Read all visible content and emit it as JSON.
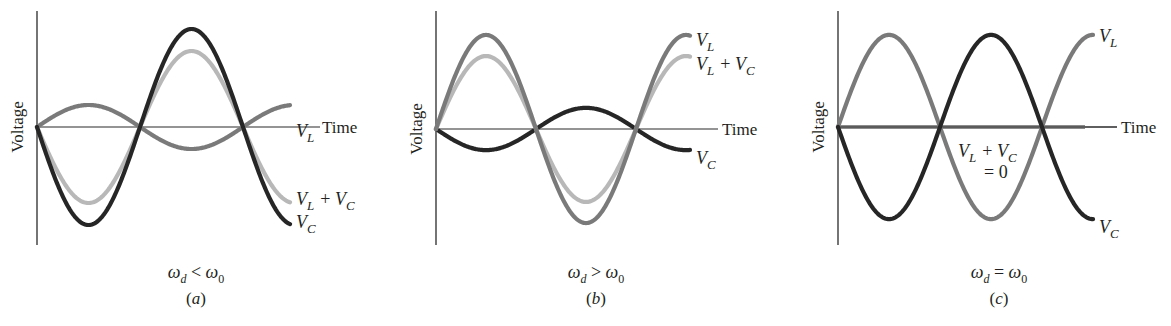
{
  "figure": {
    "shared": {
      "ylabel": "Voltage",
      "xlabel": "Time",
      "colors": {
        "axis": "#2a2a2a",
        "VL": "#7a7a7a",
        "VC": "#262626",
        "sum": "#b8b8b8"
      }
    },
    "panels": [
      {
        "id": "a",
        "caption": "(a)",
        "condition": {
          "lhs": "ω",
          "lhs_sub": "d",
          "op": "<",
          "rhs": "ω",
          "rhs_sub": "0"
        },
        "labels": {
          "VL": "V_L",
          "sum": "V_L + V_C",
          "VC": "V_C"
        }
      },
      {
        "id": "b",
        "caption": "(b)",
        "condition": {
          "lhs": "ω",
          "lhs_sub": "d",
          "op": ">",
          "rhs": "ω",
          "rhs_sub": "0"
        },
        "labels": {
          "VL": "V_L",
          "sum": "V_L + V_C",
          "VC": "V_C"
        }
      },
      {
        "id": "c",
        "caption": "(c)",
        "condition": {
          "lhs": "ω",
          "lhs_sub": "d",
          "op": "=",
          "rhs": "ω",
          "rhs_sub": "0"
        },
        "labels": {
          "VL": "V_L",
          "sum": "V_L + V_C",
          "sum_eq": "= 0",
          "VC": "V_C"
        }
      }
    ]
  },
  "chart_data": [
    {
      "type": "line",
      "title": "(a) ω_d < ω_0",
      "xlabel": "Time",
      "ylabel": "Voltage",
      "grid": false,
      "x_unit": "radians of phase (ω_d t)",
      "x_range": [
        0,
        5.0
      ],
      "y_range": [
        -1,
        1
      ],
      "series": [
        {
          "name": "V_L",
          "amplitude": 0.22,
          "phase": "sin",
          "color": "#7a7a7a"
        },
        {
          "name": "V_C",
          "amplitude": 0.98,
          "phase": "-sin",
          "color": "#262626"
        },
        {
          "name": "V_L + V_C",
          "amplitude": 0.76,
          "phase": "-sin",
          "color": "#b8b8b8"
        }
      ]
    },
    {
      "type": "line",
      "title": "(b) ω_d > ω_0",
      "xlabel": "Time",
      "ylabel": "Voltage",
      "grid": false,
      "x_unit": "radians of phase (ω_d t)",
      "x_range": [
        0,
        5.0
      ],
      "y_range": [
        -1,
        1
      ],
      "series": [
        {
          "name": "V_L",
          "amplitude": 0.98,
          "phase": "sin",
          "color": "#7a7a7a"
        },
        {
          "name": "V_C",
          "amplitude": 0.22,
          "phase": "-sin",
          "color": "#262626"
        },
        {
          "name": "V_L + V_C",
          "amplitude": 0.76,
          "phase": "sin",
          "color": "#b8b8b8"
        }
      ]
    },
    {
      "type": "line",
      "title": "(c) ω_d = ω_0",
      "xlabel": "Time",
      "ylabel": "Voltage",
      "grid": false,
      "x_unit": "radians of phase (ω_d t)",
      "x_range": [
        0,
        5.0
      ],
      "y_range": [
        -1,
        1
      ],
      "series": [
        {
          "name": "V_L",
          "amplitude": 0.98,
          "phase": "sin",
          "color": "#7a7a7a"
        },
        {
          "name": "V_C",
          "amplitude": 0.98,
          "phase": "-sin",
          "color": "#262626"
        },
        {
          "name": "V_L + V_C",
          "amplitude": 0.0,
          "phase": "flat",
          "color": "#b8b8b8",
          "annotation": "V_L + V_C = 0"
        }
      ]
    }
  ],
  "geometry": [
    {
      "axisX": 37,
      "axisTop": 11,
      "axisBottom": 245,
      "zeroY": 127,
      "timeEnd": 320,
      "halfPeriod": 103,
      "xEnd": 290,
      "sumEnd": 290,
      "unit": 100,
      "lblVL": [
        296,
        137
      ],
      "lblTime": [
        322,
        133
      ],
      "lblSum": [
        296,
        205
      ],
      "lblVC": [
        296,
        228
      ],
      "capX": 196
    },
    {
      "axisX": 436,
      "axisTop": 11,
      "axisBottom": 245,
      "zeroY": 129,
      "timeEnd": 718,
      "halfPeriod": 100,
      "xEnd": 690,
      "sumEnd": 690,
      "unit": 96,
      "lblVL": [
        696,
        46
      ],
      "lblTime": [
        722,
        135
      ],
      "lblSum": [
        696,
        70
      ],
      "lblVC": [
        696,
        164
      ],
      "capX": 596
    },
    {
      "axisX": 838,
      "axisTop": 11,
      "axisBottom": 245,
      "zeroY": 127,
      "timeEnd": 1117,
      "halfPeriod": 102,
      "xEnd": 1093,
      "sumEnd": 1085,
      "unit": 94,
      "lblVL": [
        1099,
        42
      ],
      "lblTime": [
        1121,
        133
      ],
      "lblSum": [
        958,
        157
      ],
      "lblVC": [
        1099,
        233
      ],
      "capX": 999
    }
  ]
}
